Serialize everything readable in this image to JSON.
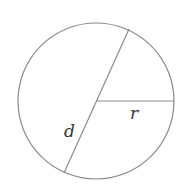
{
  "diagram": {
    "type": "circle-diagram",
    "circle": {
      "cx": 96,
      "cy": 101,
      "r": 78,
      "stroke": "#8a8a8a"
    },
    "diameter": {
      "x1": 129,
      "y1": 29,
      "x2": 64,
      "y2": 173,
      "label": "d"
    },
    "radius": {
      "x1": 96,
      "y1": 101,
      "x2": 174,
      "y2": 101,
      "label": "r"
    },
    "label_color": "#333333"
  }
}
